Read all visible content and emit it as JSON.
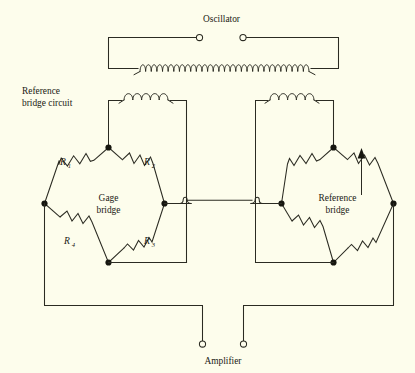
{
  "figure": {
    "title": "Reference bridge circuit",
    "background_color": "#fdfdec",
    "ink_color": "#2b2b22",
    "width": 415,
    "height": 373
  },
  "labels": {
    "oscillator": "Oscillator",
    "amplifier": "Amplifier",
    "reference_bridge_circuit_line1": "Reference",
    "reference_bridge_circuit_line2": "bridge circuit",
    "gage_bridge_line1": "Gage",
    "gage_bridge_line2": "bridge",
    "reference_bridge_line1": "Reference",
    "reference_bridge_line2": "bridge"
  },
  "gage_bridge": {
    "name": "Gage bridge",
    "resistors": [
      {
        "id": "R1",
        "letter": "R",
        "subscript": "1",
        "position": "top-left",
        "variable": false
      },
      {
        "id": "R2",
        "letter": "R",
        "subscript": "2",
        "position": "top-right",
        "variable": false
      },
      {
        "id": "R3",
        "letter": "R",
        "subscript": "3",
        "position": "bottom-right",
        "variable": false
      },
      {
        "id": "R4",
        "letter": "R",
        "subscript": "4",
        "position": "bottom-left",
        "variable": false
      }
    ]
  },
  "reference_bridge": {
    "name": "Reference bridge",
    "resistors": [
      {
        "id": "ref-top-left",
        "position": "top-left",
        "variable": false
      },
      {
        "id": "ref-top-right",
        "position": "top-right",
        "variable": true
      },
      {
        "id": "ref-bottom-right",
        "position": "bottom-right",
        "variable": false
      },
      {
        "id": "ref-bottom-left",
        "position": "bottom-left",
        "variable": false
      }
    ]
  },
  "transformer": {
    "primary_turns": 30,
    "secondary_left_turns": 5,
    "secondary_right_turns": 5
  },
  "terminals": [
    {
      "id": "oscillator-left",
      "label_group": "Oscillator"
    },
    {
      "id": "oscillator-right",
      "label_group": "Oscillator"
    },
    {
      "id": "amplifier-left",
      "label_group": "Amplifier"
    },
    {
      "id": "amplifier-right",
      "label_group": "Amplifier"
    }
  ]
}
